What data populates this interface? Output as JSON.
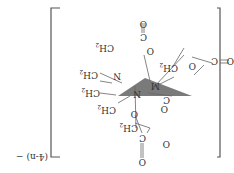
{
  "diagram": {
    "orientation": "rotated 180 degrees",
    "charge": "(4-n) −",
    "center_atom": "M",
    "atoms": {
      "n1": "N",
      "n2": "N",
      "ch2_a": "CH",
      "ch2_a_sub": "2",
      "ch2_b": "CH",
      "ch2_b_sub": "2",
      "ch2_c": "CH",
      "ch2_c_sub": "2",
      "ch2_d": "CH",
      "ch2_d_sub": "2",
      "ch2_e": "CH",
      "ch2_e_sub": "2",
      "ch2_f": "CH",
      "ch2_f_sub": "2",
      "c1": "C",
      "c2": "C",
      "c3": "C",
      "c4": "C",
      "o_carbonyl_1": "O",
      "o_carbonyl_2": "O",
      "o_carbonyl_3": "O",
      "o_carbonyl_4": "O",
      "o_lig_1": "O",
      "o_lig_2": "O",
      "o_lig_3": "O",
      "o_lig_4": "O"
    },
    "colors": {
      "plane": "#6b6b6b",
      "bond": "#666666",
      "text": "#333333"
    }
  }
}
